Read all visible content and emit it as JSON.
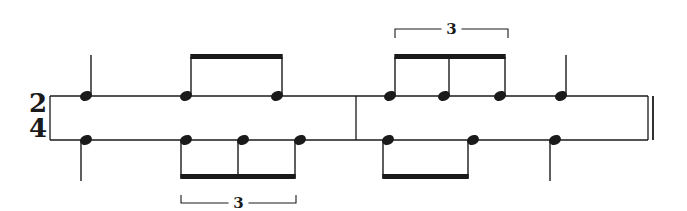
{
  "score": {
    "time_signature": {
      "numerator": "2",
      "denominator": "4"
    },
    "colors": {
      "ink": "#1a1a1a",
      "paper": "#ffffff"
    },
    "staff_lines": [
      {
        "name": "upper-voice-line",
        "y": 96
      },
      {
        "name": "lower-voice-line",
        "y": 140
      }
    ],
    "staff": {
      "x_start": 50,
      "x_end": 648,
      "barline_x": 356
    },
    "measures": [
      {
        "number": 1,
        "upper": [
          {
            "x": 86,
            "duration": "quarter",
            "stem": "up"
          },
          {
            "x": 186,
            "duration": "eighth",
            "stem": "up",
            "beam": 1
          },
          {
            "x": 277,
            "duration": "eighth",
            "stem": "up",
            "beam": 1
          }
        ],
        "lower": [
          {
            "x": 86,
            "duration": "quarter",
            "stem": "down"
          },
          {
            "x": 186,
            "duration": "eighth-triplet",
            "stem": "down",
            "beam": 2
          },
          {
            "x": 243,
            "duration": "eighth-triplet",
            "stem": "down",
            "beam": 2
          },
          {
            "x": 300,
            "duration": "eighth-triplet",
            "stem": "down",
            "beam": 2
          }
        ],
        "tuplets": [
          {
            "voice": "lower",
            "label": "3",
            "x1": 181,
            "x2": 296
          }
        ]
      },
      {
        "number": 2,
        "upper": [
          {
            "x": 390,
            "duration": "eighth-triplet",
            "stem": "up",
            "beam": 3
          },
          {
            "x": 444,
            "duration": "eighth-triplet",
            "stem": "up",
            "beam": 3
          },
          {
            "x": 500,
            "duration": "eighth-triplet",
            "stem": "up",
            "beam": 3
          },
          {
            "x": 561,
            "duration": "quarter",
            "stem": "up"
          }
        ],
        "lower": [
          {
            "x": 388,
            "duration": "eighth",
            "stem": "down",
            "beam": 4
          },
          {
            "x": 473,
            "duration": "eighth",
            "stem": "down",
            "beam": 4
          },
          {
            "x": 555,
            "duration": "quarter",
            "stem": "down"
          }
        ],
        "tuplets": [
          {
            "voice": "upper",
            "label": "3",
            "x1": 395,
            "x2": 508
          }
        ]
      }
    ],
    "final_barline": "double"
  }
}
